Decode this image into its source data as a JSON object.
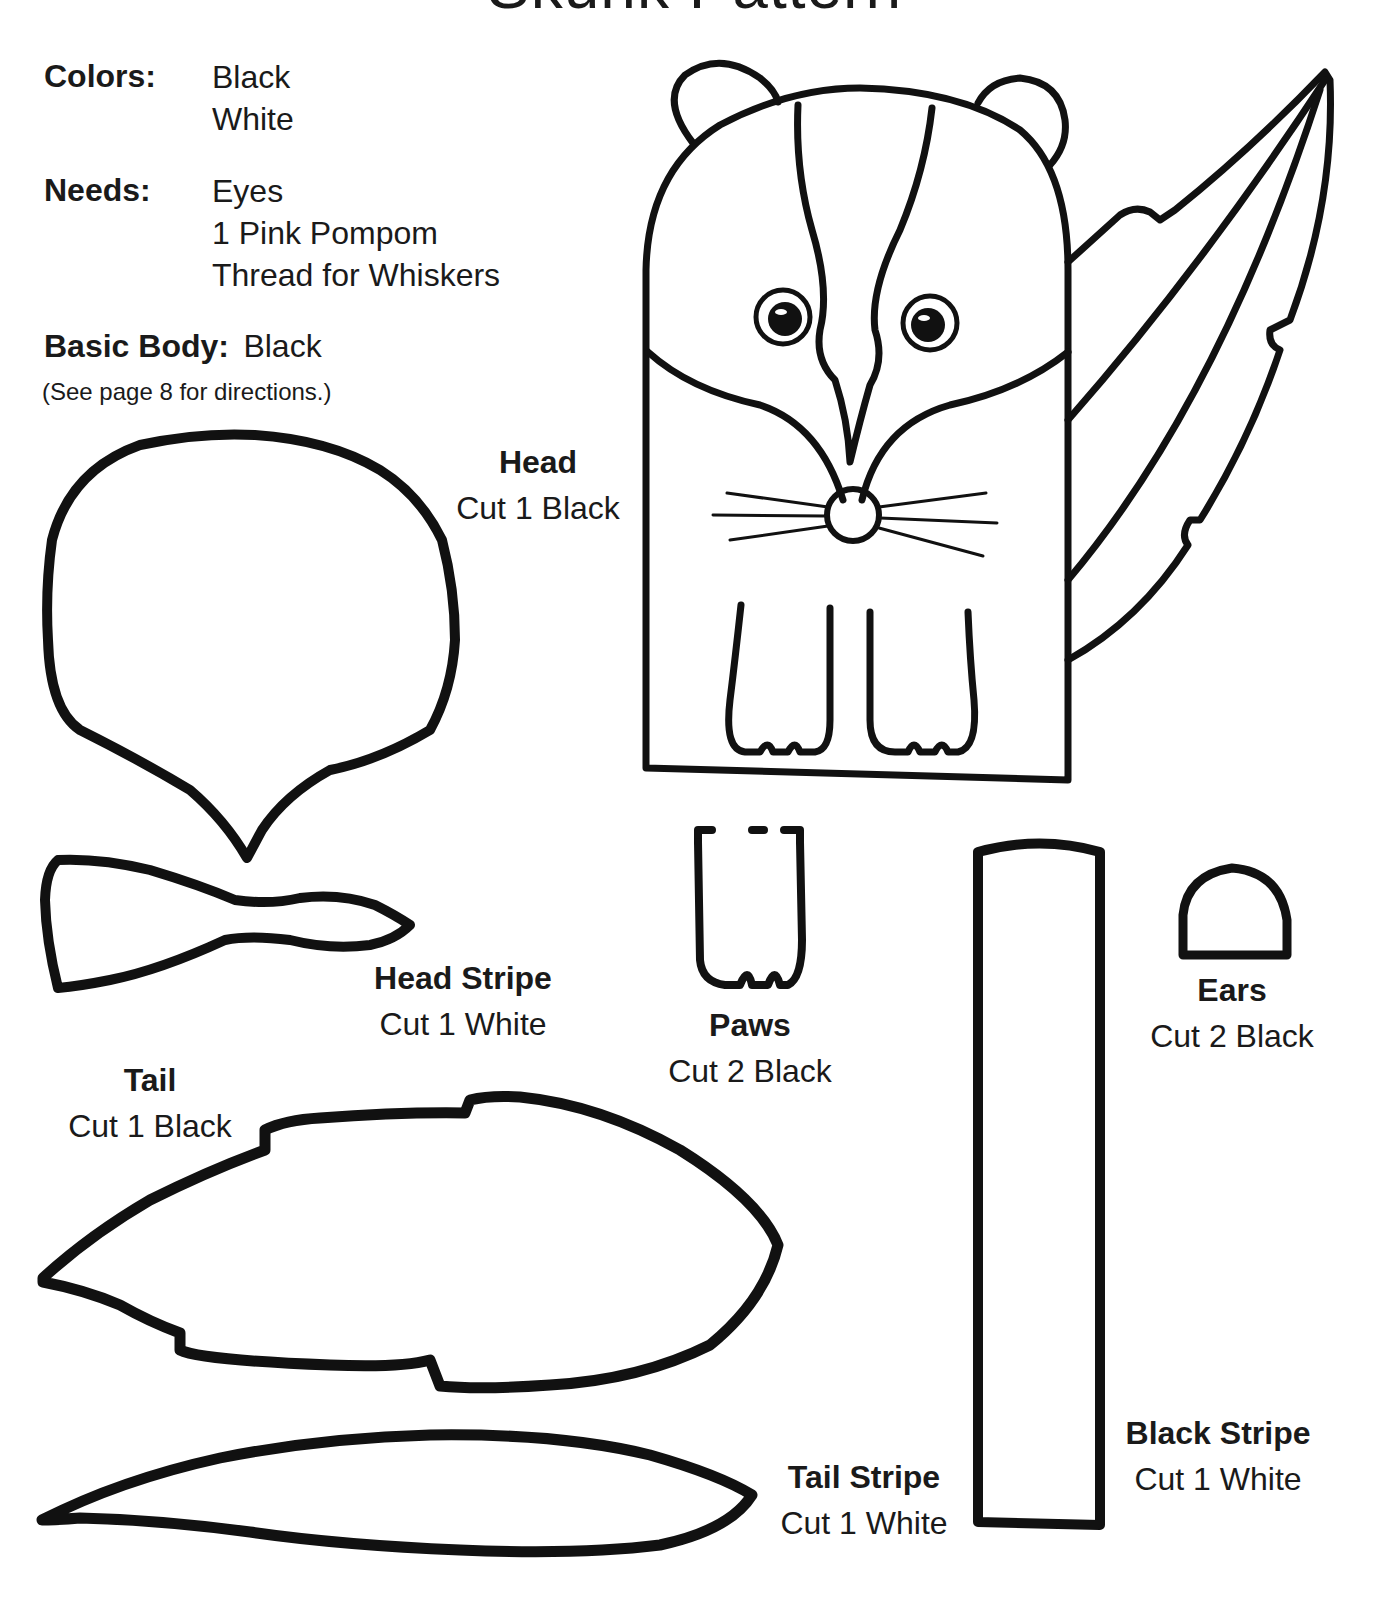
{
  "page": {
    "title": "Skunk Pattern"
  },
  "materials": {
    "colors_label": "Colors:",
    "colors": [
      "Black",
      "White"
    ],
    "needs_label": "Needs:",
    "needs": [
      "Eyes",
      "1 Pink Pompom",
      "Thread for Whiskers"
    ],
    "basic_body_label": "Basic Body:",
    "basic_body_value": "Black",
    "directions_note": "(See page 8 for directions.)"
  },
  "pieces": {
    "head": {
      "name": "Head",
      "cut": "Cut 1 Black"
    },
    "head_stripe": {
      "name": "Head Stripe",
      "cut": "Cut 1 White"
    },
    "tail": {
      "name": "Tail",
      "cut": "Cut 1 Black"
    },
    "paws": {
      "name": "Paws",
      "cut": "Cut 2 Black"
    },
    "ears": {
      "name": "Ears",
      "cut": "Cut 2 Black"
    },
    "tail_stripe": {
      "name": "Tail Stripe",
      "cut": "Cut 1 White"
    },
    "black_stripe": {
      "name": "Black Stripe",
      "cut": "Cut 1 White"
    }
  },
  "colors": {
    "ink": "#111111",
    "paper": "#ffffff"
  }
}
